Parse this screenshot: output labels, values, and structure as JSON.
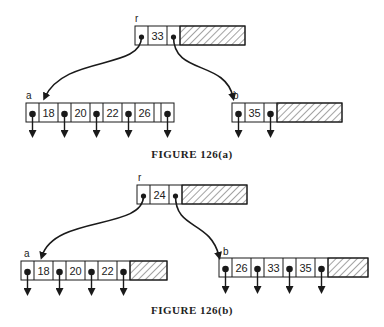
{
  "figures": [
    {
      "caption": "FIGURE 126(a)",
      "root": {
        "label": "r",
        "keys": [
          "33"
        ]
      },
      "children": [
        {
          "label": "a",
          "keys": [
            "18",
            "20",
            "22",
            "26"
          ]
        },
        {
          "label": "b",
          "keys": [
            "35"
          ]
        }
      ]
    },
    {
      "caption": "FIGURE 126(b)",
      "root": {
        "label": "r",
        "keys": [
          "24"
        ]
      },
      "children": [
        {
          "label": "a",
          "keys": [
            "18",
            "20",
            "22"
          ]
        },
        {
          "label": "b",
          "keys": [
            "26",
            "33",
            "35"
          ]
        }
      ]
    }
  ],
  "colors": {
    "line": "#1a1a1a",
    "background": "#ffffff"
  }
}
